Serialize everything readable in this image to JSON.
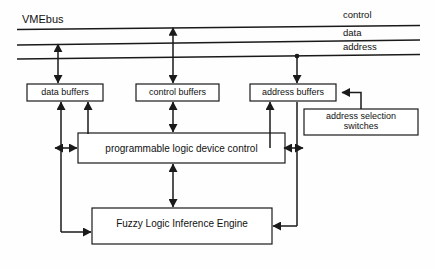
{
  "figure": {
    "title": "VMEbus",
    "background_color": "#fefefe",
    "line_color": "#1a1a1a",
    "text_color": "#111111"
  },
  "bus": {
    "name": "VMEbus",
    "lines": [
      {
        "id": "control",
        "label": "control"
      },
      {
        "id": "data",
        "label": "data"
      },
      {
        "id": "address",
        "label": "address"
      }
    ]
  },
  "blocks": [
    {
      "id": "data-buffers",
      "label": "data  buffers",
      "font_size": 9
    },
    {
      "id": "control-buffers",
      "label": "control  buffers",
      "font_size": 9
    },
    {
      "id": "address-buffers",
      "label": "address  buffers",
      "font_size": 9
    },
    {
      "id": "address-selection-switches",
      "label_line1": "address  selection",
      "label_line2": "switches",
      "font_size": 9
    },
    {
      "id": "programmable-logic-device-control",
      "label": "programmable  logic  device  control",
      "font_size": 10
    },
    {
      "id": "fuzzy-logic-inference-engine",
      "label": "Fuzzy  Logic  Inference  Engine",
      "font_size": 10
    }
  ],
  "connections": [
    {
      "id": "data-bus-to-data-buffers",
      "from": "data",
      "to": "data-buffers",
      "direction": "bidirectional"
    },
    {
      "id": "control-bus-to-control-buffers",
      "from": "control",
      "to": "control-buffers",
      "direction": "bidirectional"
    },
    {
      "id": "address-bus-to-address-buffers",
      "from": "address",
      "to": "address-buffers",
      "direction": "down"
    },
    {
      "id": "data-buffers-to-pld",
      "from": "data-buffers",
      "to": "programmable-logic-device-control",
      "direction": "bidirectional"
    },
    {
      "id": "control-buffers-to-pld",
      "from": "control-buffers",
      "to": "programmable-logic-device-control",
      "direction": "bidirectional"
    },
    {
      "id": "address-buffers-to-pld",
      "from": "address-buffers",
      "to": "programmable-logic-device-control",
      "direction": "bidirectional"
    },
    {
      "id": "address-selection-switches-to-address-buffers",
      "from": "address-selection-switches",
      "to": "address-buffers",
      "direction": "left"
    },
    {
      "id": "pld-to-fuzzy-engine",
      "from": "programmable-logic-device-control",
      "to": "fuzzy-logic-inference-engine",
      "direction": "bidirectional"
    },
    {
      "id": "data-buffers-to-fuzzy-engine",
      "from": "data-buffers",
      "to": "fuzzy-logic-inference-engine",
      "direction": "bidirectional"
    },
    {
      "id": "address-buffers-to-fuzzy-engine",
      "from": "address-buffers",
      "to": "fuzzy-logic-inference-engine",
      "direction": "bidirectional"
    }
  ]
}
